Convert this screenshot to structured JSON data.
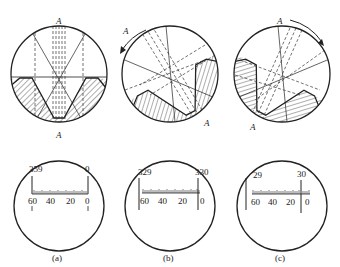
{
  "figure": {
    "panels": [
      {
        "id": "a",
        "caption": "(a)",
        "top_label": "A",
        "bottom_label": "A",
        "scale": {
          "upper_left": "359",
          "upper_right": "0",
          "lower": [
            "60",
            "40",
            "20",
            "0"
          ],
          "left_index": "1",
          "right_index": "1"
        }
      },
      {
        "id": "b",
        "caption": "(b)",
        "top_label": "A",
        "bottom_label": "A",
        "rotation": "counterclockwise",
        "scale": {
          "upper_left": "329",
          "upper_right": "330",
          "lower": [
            "60",
            "40",
            "20",
            "0"
          ]
        }
      },
      {
        "id": "c",
        "caption": "(c)",
        "top_label": "A",
        "bottom_label": "A",
        "rotation": "clockwise",
        "scale": {
          "upper_left": "29",
          "upper_right": "30",
          "lower": [
            "60",
            "40",
            "20",
            "0"
          ]
        }
      }
    ]
  },
  "colors": {
    "line": "#222222",
    "background": "#ffffff"
  }
}
